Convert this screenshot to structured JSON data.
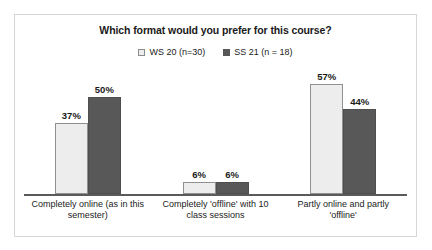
{
  "chart_data": {
    "type": "bar",
    "title": "Which format would you prefer for this course?",
    "xlabel": "",
    "ylabel": "",
    "ylim": [
      0,
      60
    ],
    "grid": false,
    "legend_position": "top-center",
    "categories": [
      "Completely online (as in this semester)",
      "Completely 'offline' with 10 class sessions",
      "Partly online and partly 'offline'"
    ],
    "series": [
      {
        "name": "WS 20 (n=30)",
        "color": "#ededed",
        "border_color": "#909090",
        "values": [
          37,
          6,
          57
        ],
        "value_labels": [
          "37%",
          "6%",
          "57%"
        ]
      },
      {
        "name": "SS 21 (n = 18)",
        "color": "#585858",
        "border_color": "#4e4e4e",
        "values": [
          50,
          6,
          44
        ],
        "value_labels": [
          "50%",
          "6%",
          "44%"
        ]
      }
    ]
  },
  "legend": {
    "entries": [
      {
        "label": "WS 20 (n=30)"
      },
      {
        "label": "SS 21 (n = 18)"
      }
    ]
  }
}
